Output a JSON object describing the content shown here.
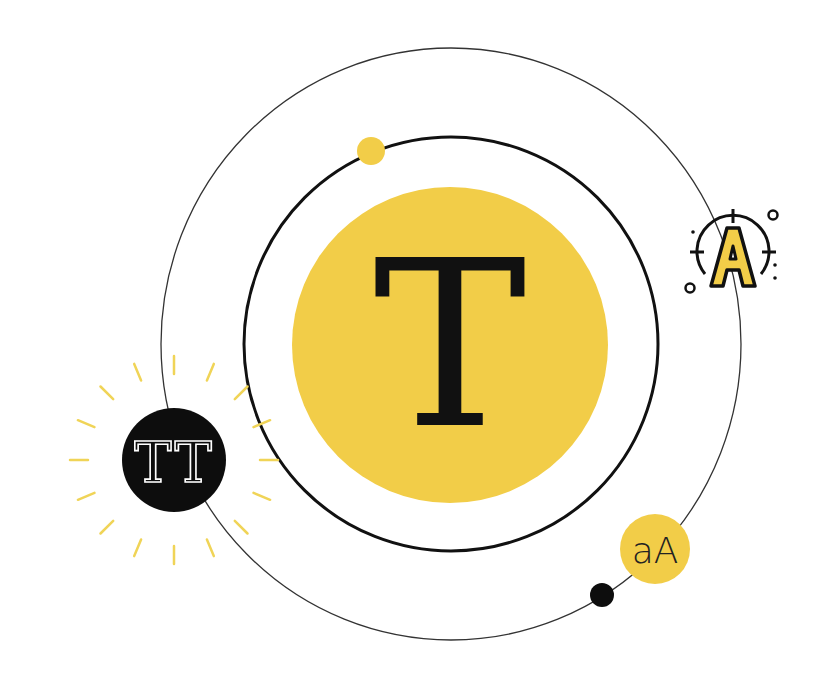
{
  "illustration": {
    "title": "Typography orbit illustration",
    "center_badge": {
      "glyph": "T",
      "fill": "#f2cd48",
      "text_color": "#111111"
    },
    "left_badge": {
      "glyph": "TT",
      "fill": "#0d0d0d",
      "text_color": "#ffffff"
    },
    "small_badge": {
      "glyph": "aA",
      "fill": "#f2cd48",
      "text_color": "#222222"
    },
    "target_icon": {
      "glyph": "A",
      "name": "letter-a-target-icon",
      "fill": "#f2cd48",
      "stroke": "#111111"
    },
    "colors": {
      "accent": "#f2cd48",
      "ray": "#f0d457",
      "orbit_inner": "#111111",
      "orbit_outer": "#333333",
      "background": "#ffffff"
    }
  }
}
